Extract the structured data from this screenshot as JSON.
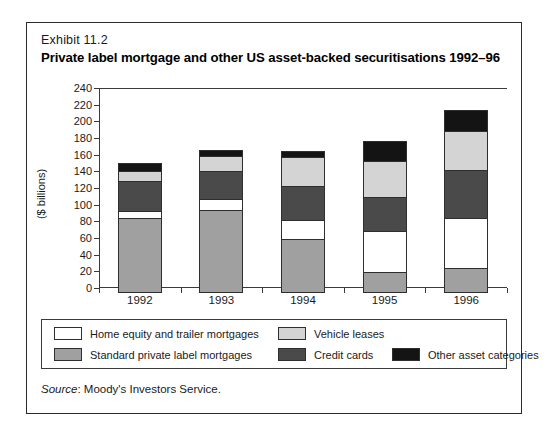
{
  "exhibit": {
    "label": "Exhibit 11.2",
    "title": "Private label mortgage and other US asset-backed securitisations 1992–96"
  },
  "source": {
    "prefix": "Source",
    "text": ": Moody's Investors Service."
  },
  "colors": {
    "home_equity": "#ffffff",
    "standard_private_label": "#a0a0a0",
    "vehicle_leases": "#d4d4d4",
    "credit_cards": "#4a4a4a",
    "other_asset": "#141414",
    "axis": "#3a3a3a",
    "frame": "#2b2b2b"
  },
  "chart_data": {
    "type": "bar",
    "stacked": true,
    "title": "Private label mortgage and other US asset-backed securitisations 1992–96",
    "xlabel": "",
    "ylabel": "($ billions)",
    "categories": [
      "1992",
      "1993",
      "1994",
      "1995",
      "1996"
    ],
    "ylim": [
      0,
      240
    ],
    "ytick_step": 20,
    "yticks": [
      0,
      20,
      40,
      60,
      80,
      100,
      120,
      140,
      160,
      180,
      200,
      220,
      240
    ],
    "grid": false,
    "legend_position": "bottom",
    "series": [
      {
        "name": "Standard private label mortgages",
        "color": "#a0a0a0",
        "values": [
          90,
          100,
          65,
          25,
          30
        ]
      },
      {
        "name": "Home equity and trailer mortgages",
        "color": "#ffffff",
        "values": [
          8,
          13,
          23,
          50,
          60
        ]
      },
      {
        "name": "Credit cards",
        "color": "#4a4a4a",
        "values": [
          37,
          34,
          40,
          40,
          58
        ]
      },
      {
        "name": "Vehicle leases",
        "color": "#d4d4d4",
        "values": [
          11,
          18,
          35,
          43,
          47
        ]
      },
      {
        "name": "Other asset categories",
        "color": "#141414",
        "values": [
          10,
          7,
          7,
          24,
          25
        ]
      }
    ],
    "totals": [
      156,
      172,
      170,
      182,
      220
    ]
  },
  "legend": {
    "items": [
      {
        "label": "Home equity and trailer mortgages",
        "color": "#ffffff"
      },
      {
        "label": "Vehicle leases",
        "color": "#d4d4d4"
      },
      {
        "label": "Standard private label mortgages",
        "color": "#a0a0a0"
      },
      {
        "label": "Credit cards",
        "color": "#4a4a4a"
      },
      {
        "label": "Other asset categories",
        "color": "#141414"
      }
    ]
  }
}
